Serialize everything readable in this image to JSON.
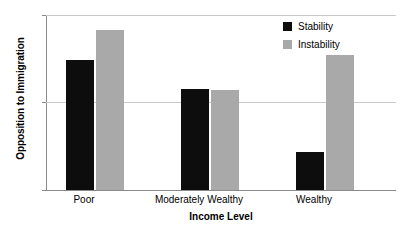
{
  "chart_data": {
    "type": "bar",
    "title": "",
    "xlabel": "Income Level",
    "ylabel": "Opposition to Immigration",
    "categories": [
      "Poor",
      "Moderately Wealthy",
      "Wealthy"
    ],
    "series": [
      {
        "name": "Stability",
        "color": "#0d0d0d",
        "values": [
          3.49,
          3.15,
          2.43
        ]
      },
      {
        "name": "Instability",
        "color": "#a9a9a9",
        "values": [
          3.83,
          3.14,
          3.54
        ]
      }
    ],
    "ylim": [
      2,
      4
    ],
    "yticks": [
      2,
      3,
      4
    ],
    "ytick_labels": [
      "2",
      "3",
      "4"
    ],
    "grid": true,
    "legend_position": "top-right"
  },
  "axes": {
    "y_title": "Opposition to Immigration",
    "x_title": "Income Level",
    "y_tick_0": "2",
    "y_tick_1": "3",
    "y_tick_2": "4"
  },
  "categories": {
    "c0": "Poor",
    "c1": "Moderately Wealthy",
    "c2": "Wealthy"
  },
  "legend": {
    "item_0": "Stability",
    "item_1": "Instability"
  },
  "colors": {
    "stability": "#0d0d0d",
    "instability": "#a9a9a9",
    "gridline": "#c9c9c9",
    "axis": "#8a8a8a",
    "background": "#ffffff"
  }
}
